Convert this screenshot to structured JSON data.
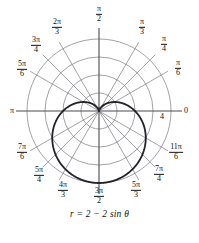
{
  "figure": {
    "caption": "r = 2 − 2 sin θ",
    "radial_tick": {
      "label": "4",
      "value": 4
    }
  },
  "angle_labels": [
    {
      "name": "zero",
      "text": "0",
      "type": "plain",
      "num": "",
      "den": "",
      "deg": 0,
      "x": 186,
      "y": 111
    },
    {
      "name": "pi-over-6",
      "text": "π/6",
      "type": "frac",
      "num": "π",
      "den": "6",
      "deg": 30,
      "x": 178,
      "y": 68
    },
    {
      "name": "pi-over-4",
      "text": "π/4",
      "type": "frac",
      "num": "π",
      "den": "4",
      "deg": 45,
      "x": 164,
      "y": 44
    },
    {
      "name": "pi-over-3",
      "text": "π/3",
      "type": "frac",
      "num": "π",
      "den": "3",
      "deg": 60,
      "x": 142,
      "y": 27
    },
    {
      "name": "pi-over-2",
      "text": "π/2",
      "type": "frac",
      "num": "π",
      "den": "2",
      "deg": 90,
      "x": 99,
      "y": 14
    },
    {
      "name": "two-pi-over-3",
      "text": "2π/3",
      "type": "frac",
      "num": "2π",
      "den": "3",
      "deg": 120,
      "x": 57,
      "y": 27
    },
    {
      "name": "three-pi-over-4",
      "text": "3π/4",
      "type": "frac",
      "num": "3π",
      "den": "4",
      "deg": 135,
      "x": 36,
      "y": 45
    },
    {
      "name": "five-pi-over-6",
      "text": "5π/6",
      "type": "frac",
      "num": "5π",
      "den": "6",
      "deg": 150,
      "x": 22,
      "y": 69
    },
    {
      "name": "pi",
      "text": "π",
      "type": "plain",
      "num": "",
      "den": "",
      "deg": 180,
      "x": 12,
      "y": 111
    },
    {
      "name": "seven-pi-over-6",
      "text": "7π/6",
      "type": "frac",
      "num": "7π",
      "den": "6",
      "deg": 210,
      "x": 22,
      "y": 152
    },
    {
      "name": "five-pi-over-4",
      "text": "5π/4",
      "type": "frac",
      "num": "5π",
      "den": "4",
      "deg": 225,
      "x": 39,
      "y": 175
    },
    {
      "name": "four-pi-over-3",
      "text": "4π/3",
      "type": "frac",
      "num": "4π",
      "den": "3",
      "deg": 240,
      "x": 63,
      "y": 190
    },
    {
      "name": "three-pi-over-2",
      "text": "3π/2",
      "type": "frac",
      "num": "3π",
      "den": "2",
      "deg": 270,
      "x": 99,
      "y": 196
    },
    {
      "name": "five-pi-over-3",
      "text": "5π/3",
      "type": "frac",
      "num": "5π",
      "den": "3",
      "deg": 300,
      "x": 136,
      "y": 190
    },
    {
      "name": "seven-pi-over-4",
      "text": "7π/4",
      "type": "frac",
      "num": "7π",
      "den": "4",
      "deg": 315,
      "x": 159,
      "y": 174
    },
    {
      "name": "eleven-pi-over-6",
      "text": "11π/6",
      "type": "frac",
      "num": "11π",
      "den": "6",
      "deg": 330,
      "x": 176,
      "y": 152
    }
  ],
  "chart_data": {
    "type": "line",
    "coordinate_system": "polar",
    "title": "",
    "caption": "r = 2 − 2 sin θ",
    "equation": "r = 2 - 2*sin(theta)",
    "curve_name": "cardioid",
    "rlim": [
      0,
      4
    ],
    "radial_ticks": [
      1,
      2,
      3,
      4
    ],
    "radial_tick_labels": [
      "",
      "",
      "",
      "4"
    ],
    "theta_ticks_deg": [
      0,
      30,
      45,
      60,
      90,
      120,
      135,
      150,
      180,
      210,
      225,
      240,
      270,
      300,
      315,
      330
    ],
    "theta_tick_labels": [
      "0",
      "π/6",
      "π/4",
      "π/3",
      "π/2",
      "2π/3",
      "3π/4",
      "5π/6",
      "π",
      "7π/6",
      "5π/4",
      "4π/3",
      "3π/2",
      "5π/3",
      "7π/4",
      "11π/6"
    ],
    "grid": true,
    "legend": false,
    "series": [
      {
        "name": "r = 2 - 2 sin θ",
        "theta_deg": [
          0,
          15,
          30,
          45,
          60,
          75,
          90,
          105,
          120,
          135,
          150,
          165,
          180,
          195,
          210,
          225,
          240,
          255,
          270,
          285,
          300,
          315,
          330,
          345,
          360
        ],
        "r": [
          2.0,
          1.48,
          1.0,
          0.59,
          0.27,
          0.07,
          0.0,
          0.07,
          0.27,
          0.59,
          1.0,
          1.48,
          2.0,
          2.52,
          3.0,
          3.41,
          3.73,
          3.93,
          4.0,
          3.93,
          3.73,
          3.41,
          3.0,
          2.52,
          2.0
        ]
      }
    ]
  },
  "style": {
    "grid_color": "#7b7b82",
    "axis_color": "#4a4a4f",
    "curve_color": "#222228",
    "text_color": "#111111",
    "background": "#ffffff"
  }
}
